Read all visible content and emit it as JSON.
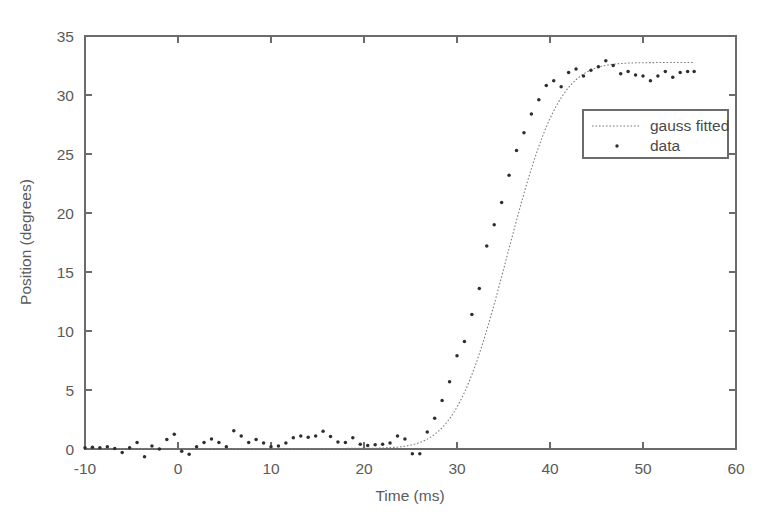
{
  "chart_data": {
    "type": "scatter",
    "title": "",
    "xlabel": "Time (ms)",
    "ylabel": "Position (degrees)",
    "xlim": [
      -10,
      60
    ],
    "ylim": [
      0,
      35
    ],
    "xticks": [
      -10,
      0,
      10,
      20,
      30,
      40,
      50,
      60
    ],
    "yticks": [
      0,
      5,
      10,
      15,
      20,
      25,
      30,
      35
    ],
    "xtick_labels": [
      "-10",
      "0",
      "10",
      "20",
      "30",
      "40",
      "50",
      "60"
    ],
    "ytick_labels": [
      "0",
      "5",
      "10",
      "15",
      "20",
      "25",
      "30",
      "35"
    ],
    "grid": false,
    "legend_position": "center-right",
    "legend": [
      {
        "label": "gauss fitted",
        "marker": "dotted-line"
      },
      {
        "label": "data",
        "marker": "dot"
      }
    ],
    "series": [
      {
        "name": "gauss fitted",
        "type": "line",
        "style": "dotted",
        "color": "#7a7a7a",
        "model": "sigmoid (gaussian cumulative)",
        "params": {
          "amplitude": 32.7,
          "midpoint_ms": 35.4,
          "width_ms": 4.35,
          "baseline": 0.05
        },
        "x_range": [
          -10,
          55.5
        ]
      },
      {
        "name": "data",
        "type": "scatter",
        "marker": "point",
        "color": "#2e2e2e",
        "x": [
          -10.0,
          -9.2,
          -8.4,
          -7.6,
          -6.8,
          -6.0,
          -5.2,
          -4.4,
          -3.6,
          -2.8,
          -2.0,
          -1.2,
          -0.4,
          0.4,
          1.2,
          2.0,
          2.8,
          3.6,
          4.4,
          5.2,
          6.0,
          6.8,
          7.6,
          8.4,
          9.2,
          10.0,
          10.8,
          11.6,
          12.4,
          13.2,
          14.0,
          14.8,
          15.6,
          16.4,
          17.2,
          18.0,
          18.8,
          19.6,
          20.4,
          21.2,
          22.0,
          22.8,
          23.6,
          24.4,
          25.2,
          26.0,
          26.8,
          27.6,
          28.4,
          29.2,
          30.0,
          30.8,
          31.6,
          32.4,
          33.2,
          34.0,
          34.8,
          35.6,
          36.4,
          37.2,
          38.0,
          38.8,
          39.6,
          40.4,
          41.2,
          42.0,
          42.8,
          43.6,
          44.4,
          45.2,
          46.0,
          46.8,
          47.6,
          48.4,
          49.2,
          50.0,
          50.8,
          51.6,
          52.4,
          53.2,
          54.0,
          54.8,
          55.5
        ],
        "y": [
          0.1,
          0.15,
          0.1,
          0.2,
          0.05,
          -0.3,
          0.1,
          0.55,
          -0.65,
          0.25,
          0.0,
          0.8,
          1.25,
          -0.2,
          -0.45,
          0.2,
          0.55,
          0.85,
          0.55,
          0.2,
          1.55,
          1.1,
          0.55,
          0.8,
          0.5,
          0.2,
          0.25,
          0.5,
          0.95,
          1.1,
          1.0,
          1.1,
          1.5,
          1.05,
          0.6,
          0.55,
          0.95,
          0.4,
          0.3,
          0.35,
          0.4,
          0.5,
          1.1,
          0.85,
          -0.4,
          -0.4,
          1.45,
          2.6,
          4.1,
          5.7,
          7.9,
          9.1,
          11.4,
          13.6,
          17.2,
          19.0,
          20.9,
          23.2,
          25.3,
          26.8,
          28.4,
          29.6,
          30.8,
          31.2,
          30.7,
          31.9,
          32.2,
          31.6,
          32.1,
          32.4,
          32.9,
          32.5,
          31.8,
          32.0,
          31.7,
          31.6,
          31.2,
          31.6,
          32.0,
          31.5,
          31.9,
          32.0,
          32.0
        ]
      }
    ]
  },
  "figure": {
    "background_color": "#ffffff",
    "axis_color": "#6b6b6b",
    "text_color": "#4a4a4a"
  }
}
